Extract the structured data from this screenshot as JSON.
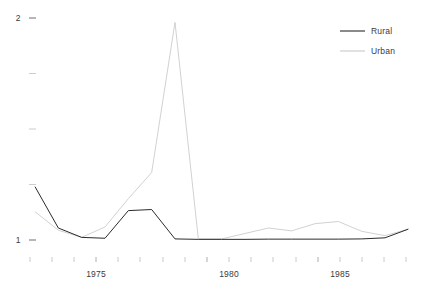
{
  "chart_data": {
    "type": "line",
    "title": "",
    "subtitle": "",
    "xlabel": "",
    "ylabel": "",
    "xlim": [
      1972.0,
      1988.2
    ],
    "ylim": [
      1.0,
      2.02
    ],
    "grid": false,
    "legend_position": "top-right",
    "x_tick_labels": [
      "1975",
      "1980",
      "1985"
    ],
    "x_labeled_ticks": [
      1975,
      1980,
      1985
    ],
    "x_minor_ticks": [
      1972,
      1973,
      1974,
      1975,
      1976,
      1977,
      1978,
      1979,
      1980,
      1981,
      1982,
      1983,
      1984,
      1985,
      1986,
      1987,
      1988
    ],
    "y_tick_labels": [
      "1",
      "2"
    ],
    "y_labeled_ticks": [
      1,
      2
    ],
    "y_minor_ticks": [
      1.0,
      1.25,
      1.5,
      1.75,
      2.0
    ],
    "x": [
      1972.0,
      1973.0,
      1974.0,
      1975.0,
      1976.0,
      1977.0,
      1978.0,
      1979.0,
      1980.0,
      1981.0,
      1982.0,
      1983.0,
      1984.0,
      1985.0,
      1986.0,
      1987.0,
      1988.0
    ],
    "series": [
      {
        "name": "Rural",
        "color": "#2b2b2b",
        "values": [
          1.245,
          1.055,
          1.012,
          1.008,
          1.135,
          1.14,
          1.005,
          1.003,
          1.003,
          1.003,
          1.004,
          1.004,
          1.004,
          1.004,
          1.005,
          1.01,
          1.05
        ]
      },
      {
        "name": "Urban",
        "color": "#c9c9c9",
        "values": [
          1.13,
          1.045,
          1.012,
          1.06,
          1.19,
          1.31,
          2.0,
          1.005,
          1.005,
          1.03,
          1.055,
          1.042,
          1.075,
          1.085,
          1.04,
          1.02,
          1.05
        ]
      }
    ]
  },
  "legend": {
    "items": [
      {
        "label": "Rural",
        "color": "#2b2b2b"
      },
      {
        "label": "Urban",
        "color": "#c9c9c9"
      }
    ]
  },
  "axes": {
    "y_top_label": "2",
    "y_bottom_label": "1",
    "x_label_1": "1975",
    "x_label_2": "1980",
    "x_label_3": "1985"
  }
}
